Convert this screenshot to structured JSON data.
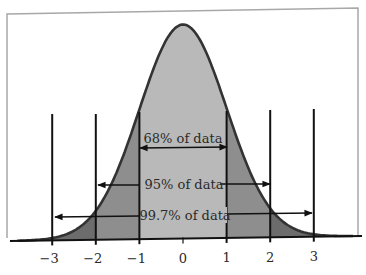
{
  "chart_data": {
    "type": "area",
    "title": "",
    "subtitle": "",
    "xlabel": "",
    "ylabel": "",
    "distribution": "standard normal",
    "x_ticks": [
      -3,
      -2,
      -1,
      0,
      1,
      2,
      3
    ],
    "x_tick_labels": [
      "−3",
      "−2",
      "−1",
      "0",
      "1",
      "2",
      "3"
    ],
    "xlim": [
      -4,
      4
    ],
    "grid": false,
    "legend": null,
    "regions": [
      {
        "name": "within 1 SD",
        "from": -1,
        "to": 1,
        "color": "#b9b9b9"
      },
      {
        "name": "between 1 and 2 SD",
        "from": 1,
        "to": 2,
        "color": "#8e8e8e",
        "symmetric": true
      },
      {
        "name": "between 2 and 3 SD",
        "from": 2,
        "to": 3,
        "color": "#6c6c6c",
        "symmetric": true
      }
    ],
    "annotations": [
      {
        "text": "68% of data",
        "from": -1,
        "to": 1,
        "percent": 68
      },
      {
        "text": "95% of data",
        "from": -2,
        "to": 2,
        "percent": 95
      },
      {
        "text": "99.7% of data",
        "from": -3,
        "to": 3,
        "percent": 99.7
      }
    ]
  },
  "labels": {
    "ticks": [
      "−3",
      "−2",
      "−1",
      "0",
      "1",
      "2",
      "3"
    ],
    "pct68": "68% of data",
    "pct95": "95% of data",
    "pct997": "99.7% of data"
  },
  "colors": {
    "center": "#b9b9b9",
    "mid": "#8e8e8e",
    "tail": "#6c6c6c",
    "curve": "#333333",
    "lines": "#111111",
    "frame": "#a8a8a8"
  }
}
